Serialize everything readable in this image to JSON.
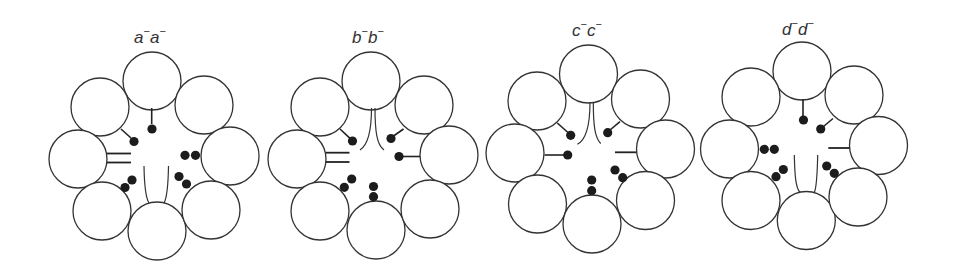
{
  "figure": {
    "width": 956,
    "height": 274,
    "circle_radius": 29,
    "bead_radius": 4.6,
    "colors": {
      "stroke": "#333333",
      "fill": "#ffffff",
      "bead": "#1c1c1c",
      "text": "#333333"
    },
    "panels": [
      {
        "id": "a",
        "label": {
          "text": "a⁻a⁻",
          "letter": "a",
          "superscript": "−",
          "x": 134,
          "y": 43
        },
        "circles": [
          [
            152,
            81
          ],
          [
            100,
            107
          ],
          [
            204,
            105
          ],
          [
            78,
            159
          ],
          [
            230,
            156
          ],
          [
            102,
            211
          ],
          [
            157,
            231
          ],
          [
            211,
            210
          ]
        ],
        "stems": [
          {
            "from": [
              151.7,
              108
            ],
            "to": [
              151.7,
              124
            ],
            "bead": [
              152,
              129
            ]
          },
          {
            "from": [
              121,
              129
            ],
            "to": [
              131,
              138
            ],
            "bead": [
              134,
              141.5
            ]
          }
        ],
        "lines": [
          {
            "from": [
              107,
              153.5
            ],
            "to": [
              131,
              153.5
            ],
            "kind": "double-line"
          },
          {
            "from": [
              107,
              162.5
            ],
            "to": [
              131,
              162.5
            ],
            "kind": "double-line"
          }
        ],
        "bead_pairs": [
          [
            [
              132,
              180
            ],
            [
              125,
              187.5
            ]
          ],
          [
            [
              185,
              155.3
            ],
            [
              195.5,
              155.3
            ]
          ],
          [
            [
              179,
              176.5
            ],
            [
              186.5,
              184
            ]
          ]
        ],
        "curves": [
          "M144,166 Q144.5,196 149,203",
          "M168.5,166 Q168,196 164,203"
        ]
      },
      {
        "id": "b",
        "label": {
          "text": "b⁻b⁻",
          "letter": "b",
          "superscript": "−",
          "x": 352,
          "y": 43
        },
        "circles": [
          [
            371,
            81
          ],
          [
            320,
            107
          ],
          [
            424,
            105
          ],
          [
            297,
            159
          ],
          [
            449,
            155
          ],
          [
            320,
            211
          ],
          [
            376,
            230
          ],
          [
            430,
            209
          ]
        ],
        "stems": [
          {
            "from": [
              340,
              129
            ],
            "to": [
              350,
              138.3
            ],
            "bead": [
              352.5,
              141
            ]
          },
          {
            "from": [
              403.5,
              129
            ],
            "to": [
              393.5,
              136
            ],
            "bead": [
              391,
              138.5
            ]
          },
          {
            "from": [
              420,
              156.5
            ],
            "to": [
              402,
              156.5
            ],
            "bead": [
              399,
              156.5
            ]
          }
        ],
        "lines": [
          {
            "from": [
              326,
              152.7
            ],
            "to": [
              349.5,
              152.7
            ],
            "kind": "double-line"
          },
          {
            "from": [
              326,
              162
            ],
            "to": [
              349.5,
              162
            ],
            "kind": "double-line"
          }
        ],
        "bead_pairs": [
          [
            [
              351.7,
              179
            ],
            [
              344.3,
              187.3
            ]
          ],
          [
            [
              373.5,
              186.5
            ],
            [
              373.5,
              196.7
            ]
          ]
        ],
        "curves": [
          "M371.5,108 C371.5,132 368,145 360,150",
          "M375,108 C375,132 377,145 384,150"
        ]
      },
      {
        "id": "c",
        "label": {
          "text": "c⁻c⁻",
          "letter": "c",
          "superscript": "−",
          "x": 572,
          "y": 36
        },
        "circles": [
          [
            588.5,
            74
          ],
          [
            537,
            101
          ],
          [
            640.5,
            99
          ],
          [
            515,
            153
          ],
          [
            665.5,
            149
          ],
          [
            537.5,
            204
          ],
          [
            592,
            224
          ],
          [
            645.5,
            200.5
          ]
        ],
        "stems": [
          {
            "from": [
              557.3,
              123
            ],
            "to": [
              568,
              132.5
            ],
            "bead": [
              570.7,
              135.3
            ]
          },
          {
            "from": [
              620,
              121.7
            ],
            "to": [
              610,
              130
            ],
            "bead": [
              607.7,
              132.7
            ]
          },
          {
            "from": [
              544.5,
              155
            ],
            "to": [
              565,
              155
            ],
            "bead": [
              567.7,
              155
            ]
          }
        ],
        "lines": [
          {
            "from": [
              615,
              152.3
            ],
            "to": [
              636.5,
              152.3
            ],
            "kind": "single-line"
          }
        ],
        "bead_pairs": [
          [
            [
              615,
              170
            ],
            [
              622.7,
              177.7
            ]
          ],
          [
            [
              591.7,
              180
            ],
            [
              591.7,
              190.7
            ]
          ]
        ],
        "curves": [
          "M590,102 C590,126 586,140 577.3,144.3",
          "M593.3,102 C593.3,126 595,138 600.7,143.5"
        ]
      },
      {
        "id": "d",
        "label": {
          "text": "d⁻d⁻",
          "letter": "d",
          "superscript": "−",
          "x": 782,
          "y": 35
        },
        "circles": [
          [
            802,
            71
          ],
          [
            751,
            97
          ],
          [
            854,
            95
          ],
          [
            729.5,
            149
          ],
          [
            878.5,
            145.5
          ],
          [
            751,
            200.5
          ],
          [
            806.3,
            220.5
          ],
          [
            858,
            197
          ]
        ],
        "stems": [
          {
            "from": [
              803,
              99
            ],
            "to": [
              803,
              116
            ],
            "bead": [
              803.5,
              120
            ]
          },
          {
            "from": [
              833,
              118.5
            ],
            "to": [
              823.5,
              126.5
            ],
            "bead": [
              820.7,
              129
            ]
          }
        ],
        "lines": [
          {
            "from": [
              828.3,
              148
            ],
            "to": [
              850,
              148
            ],
            "kind": "single-line"
          }
        ],
        "bead_pairs": [
          [
            [
              764.3,
              149.3
            ],
            [
              774.3,
              149.3
            ]
          ],
          [
            [
              783.3,
              169.5
            ],
            [
              776,
              176.7
            ]
          ],
          [
            [
              826.7,
              166
            ],
            [
              834.3,
              173.3
            ]
          ]
        ],
        "curves": [
          "M794.3,155 C794.8,178 796,188 800,192.5",
          "M817.7,155 C817.2,178 816.5,188 814.3,192.5"
        ]
      }
    ]
  }
}
